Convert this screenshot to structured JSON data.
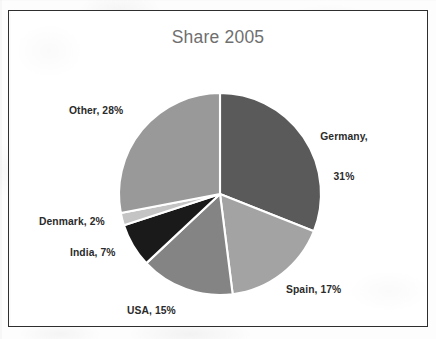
{
  "chart_data": {
    "type": "pie",
    "title": "Share 2005",
    "xlabel": "",
    "ylabel": "",
    "legend_position": "none",
    "grid": false,
    "labels_on_slices": true,
    "start_angle_deg": 0,
    "direction": "clockwise",
    "categories": [
      "Germany",
      "Spain",
      "USA",
      "India",
      "Denmark",
      "Other"
    ],
    "values": [
      31,
      17,
      15,
      7,
      2,
      28
    ],
    "unit": "%",
    "slices": [
      {
        "name": "Germany",
        "value": 31,
        "label": "Germany,\n31%",
        "label_line1": "Germany,",
        "label_line2": "31%",
        "color": "#5a5a5a"
      },
      {
        "name": "Spain",
        "value": 17,
        "label": "Spain, 17%",
        "label_line1": "Spain, 17%",
        "label_line2": "",
        "color": "#a3a3a3"
      },
      {
        "name": "USA",
        "value": 15,
        "label": "USA, 15%",
        "label_line1": "USA, 15%",
        "label_line2": "",
        "color": "#848484"
      },
      {
        "name": "India",
        "value": 7,
        "label": "India, 7%",
        "label_line1": "India, 7%",
        "label_line2": "",
        "color": "#1a1a1a"
      },
      {
        "name": "Denmark",
        "value": 2,
        "label": "Denmark, 2%",
        "label_line1": "Denmark, 2%",
        "label_line2": "",
        "color": "#c4c4c4"
      },
      {
        "name": "Other",
        "value": 28,
        "label": "Other, 28%",
        "label_line1": "Other, 28%",
        "label_line2": "",
        "color": "#999999"
      }
    ]
  },
  "chart": {
    "title": "Share 2005",
    "border_color": "#2e2e2e",
    "background_color": "#ffffff",
    "title_color": "#6f6f6f",
    "slice_separator_color": "#ffffff"
  },
  "labels": {
    "germany_line1": "Germany,",
    "germany_line2": "31%",
    "spain": "Spain, 17%",
    "usa": "USA, 15%",
    "india": "India, 7%",
    "denmark": "Denmark, 2%",
    "other": "Other, 28%"
  }
}
